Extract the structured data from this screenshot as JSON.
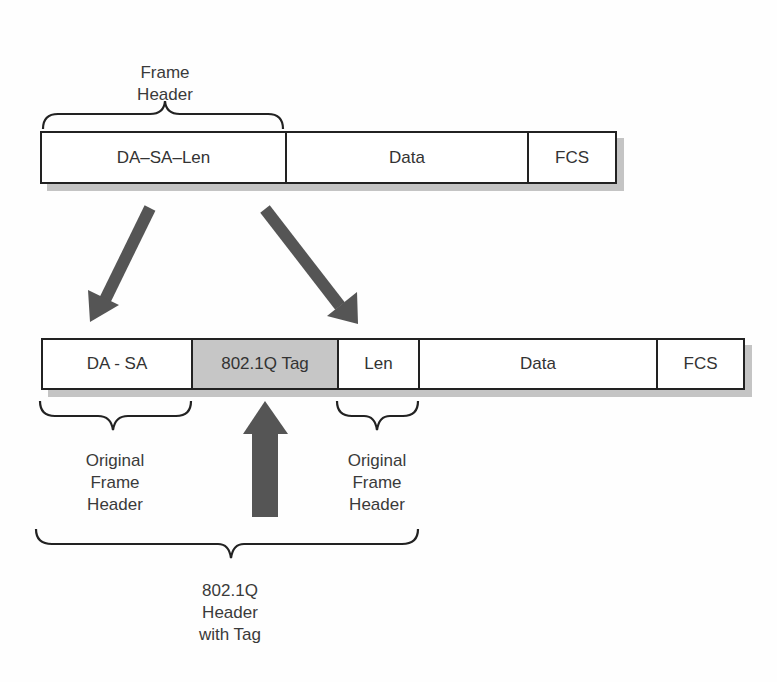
{
  "original_frame": {
    "header_label": [
      "Frame",
      "Header"
    ],
    "fields": [
      {
        "label": "DA–SA–Len"
      },
      {
        "label": "Data"
      },
      {
        "label": "FCS"
      }
    ]
  },
  "tagged_frame": {
    "fields": [
      {
        "label": "DA - SA"
      },
      {
        "label": "802.1Q Tag"
      },
      {
        "label": "Len"
      },
      {
        "label": "Data"
      },
      {
        "label": "FCS"
      }
    ],
    "left_brace_label": [
      "Original",
      "Frame",
      "Header"
    ],
    "right_brace_label": [
      "Original",
      "Frame",
      "Header"
    ],
    "bottom_brace_label": [
      "802.1Q",
      "Header",
      "with Tag"
    ]
  },
  "colors": {
    "arrow": "#555555",
    "tag_fill": "#c6c6c6",
    "shadow": "#c4c4c4",
    "border": "#222222"
  }
}
